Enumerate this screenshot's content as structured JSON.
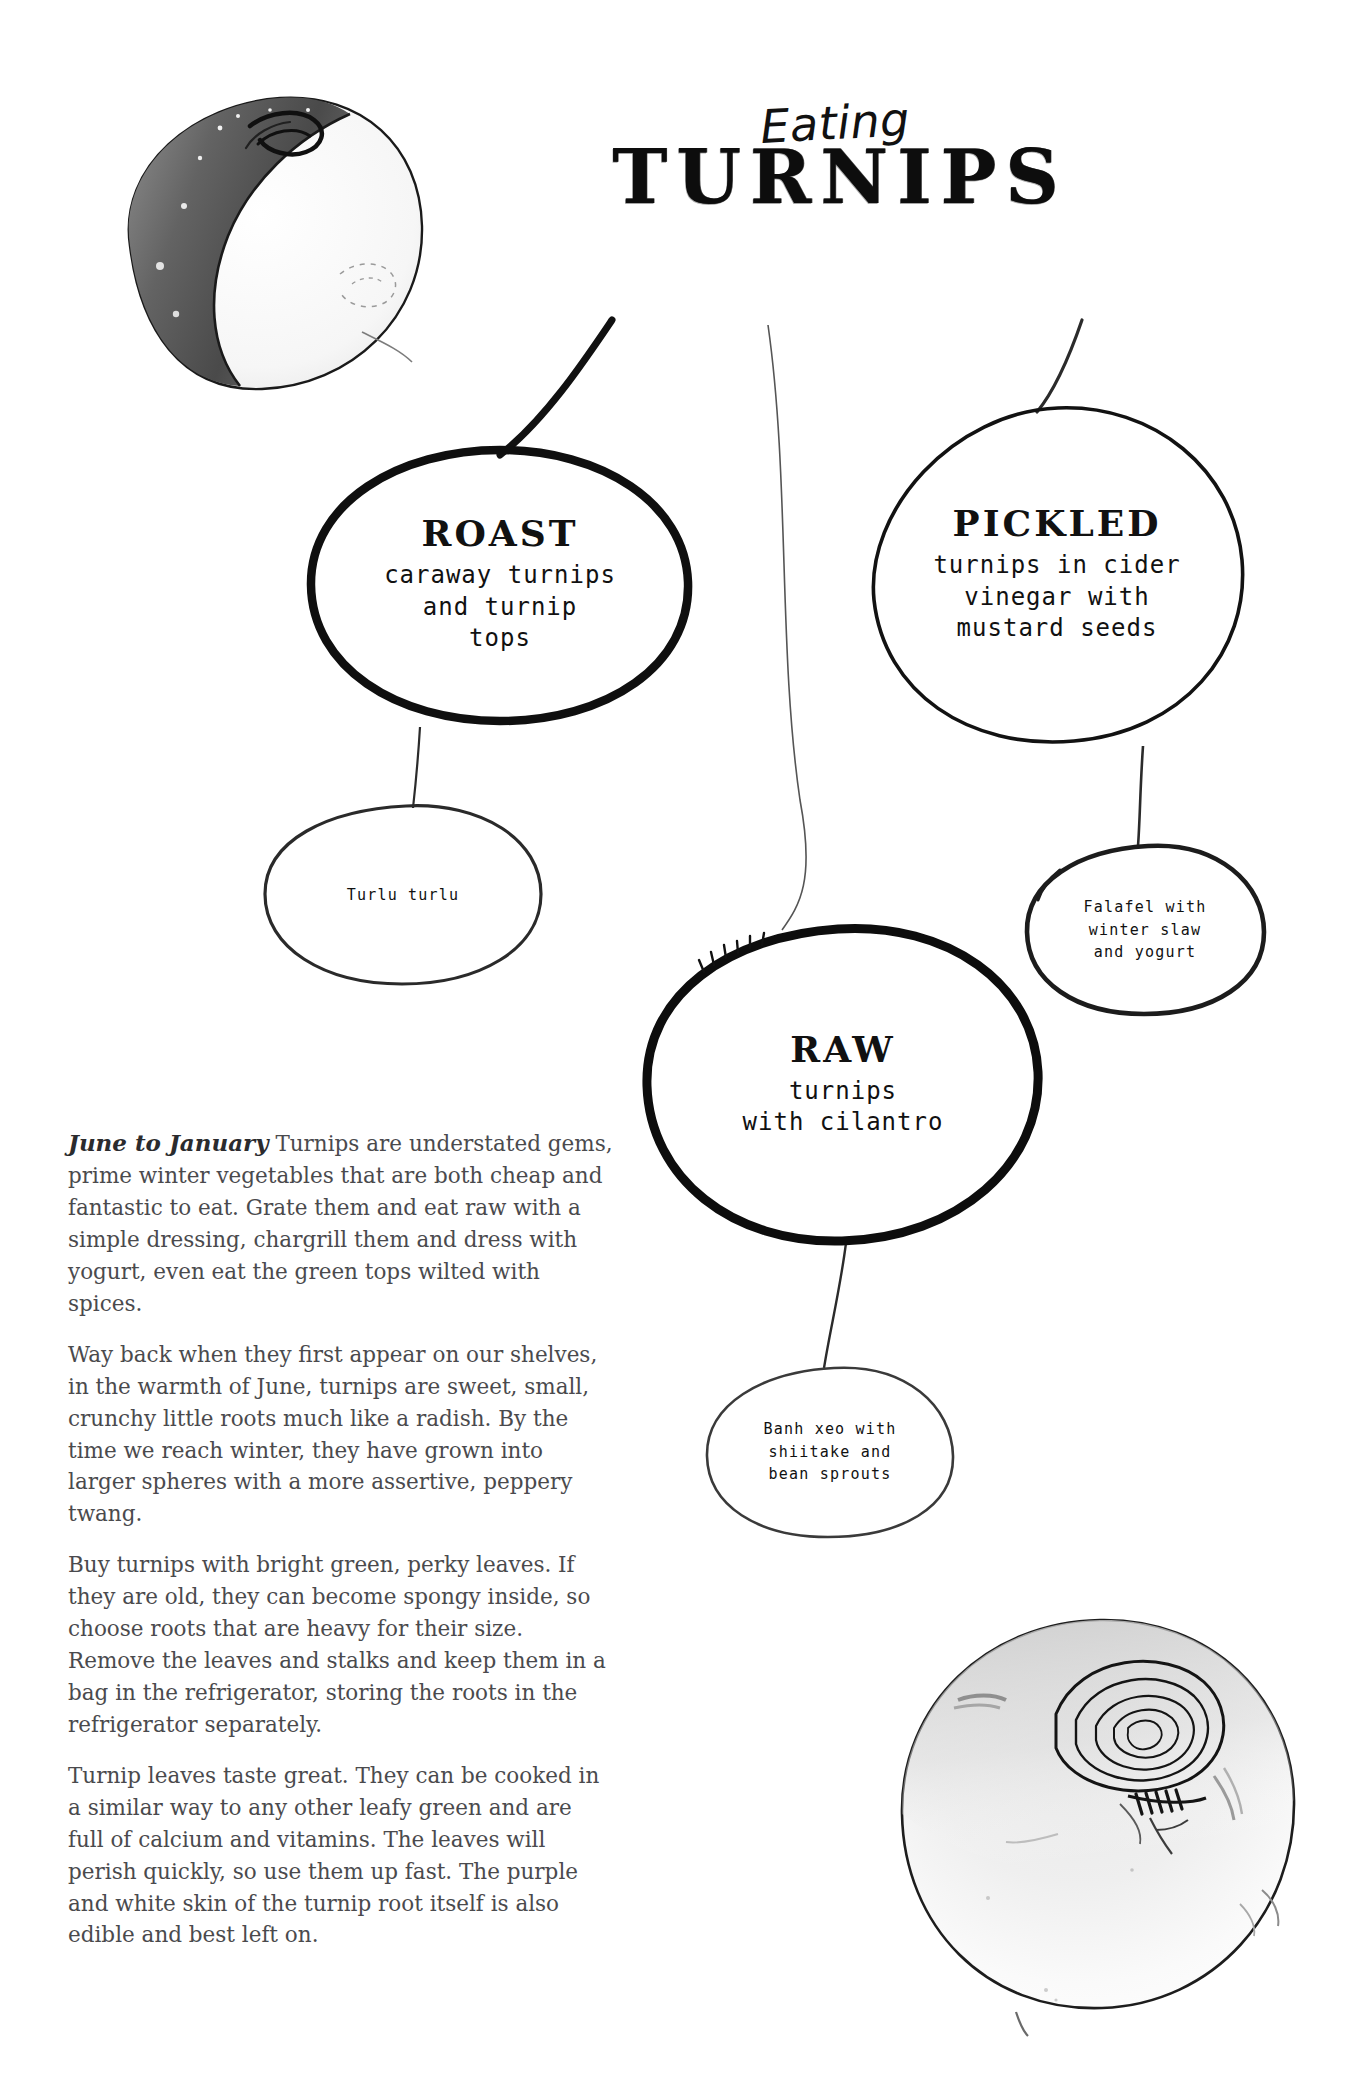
{
  "title": {
    "eyebrow": "Eating",
    "main": "TURNIPS"
  },
  "bubbles": {
    "roast": {
      "head": "ROAST",
      "lines": [
        "caraway turnips",
        "and turnip",
        "tops"
      ]
    },
    "pickled": {
      "head": "PICKLED",
      "lines": [
        "turnips in cider",
        "vinegar with",
        "mustard seeds"
      ]
    },
    "raw": {
      "head": "RAW",
      "lines": [
        "turnips",
        "with cilantro"
      ]
    },
    "turlu": {
      "lines": [
        "Turlu turlu"
      ]
    },
    "falafel": {
      "lines": [
        "Falafel with",
        "winter slaw",
        "and yogurt"
      ]
    },
    "banhxeo": {
      "lines": [
        "Banh xeo with",
        "shiitake and",
        "bean sprouts"
      ]
    }
  },
  "article": {
    "lead_in": "June to January",
    "paragraphs": [
      "Turnips are understated gems, prime winter vegetables that are both cheap and fantastic to eat. Grate them and eat raw with a simple dressing, chargrill them and dress with yogurt, even eat the green tops wilted with spices.",
      "Way back when they first appear on our shelves, in the warmth of June, turnips are sweet, small, crunchy little roots much like a radish. By the time we reach winter, they have grown into larger spheres with a more assertive, peppery twang.",
      "Buy turnips with bright green, perky leaves. If they are old, they can become spongy inside, so choose roots that are heavy for their size. Remove the leaves and stalks and keep them in a bag in the refrigerator, storing the roots in the refrigerator separately.",
      "Turnip leaves taste great. They can be cooked in a similar way to any other leafy green and are full of calcium and vitamins. The leaves will perish quickly, so use them up fast. The purple and white skin of the turnip root itself is also edible and best left on."
    ]
  },
  "illustrations": {
    "top_left": "halved-turnip-illustration",
    "bottom_right": "whole-turnip-illustration"
  },
  "colors": {
    "ink": "#111111",
    "body_text": "#4a4a4d",
    "paper": "#ffffff"
  }
}
